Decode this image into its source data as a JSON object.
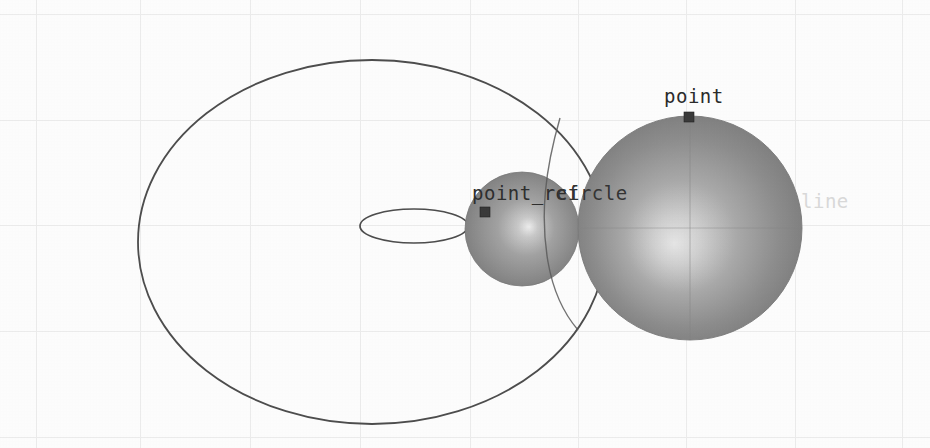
{
  "viewport": {
    "width": 930,
    "height": 448,
    "background_color": "#fdfdfd",
    "grid_color": "#ededed",
    "grid_vertical_x": [
      36,
      140,
      250,
      360,
      470,
      578,
      686,
      795,
      902
    ],
    "grid_horizontal_y": [
      14,
      120,
      225,
      331,
      437
    ]
  },
  "labels": {
    "point": "point",
    "point_ref": "point_ref",
    "circle": "circle",
    "line": "line"
  },
  "colors": {
    "label_dark": "#2b2b2b",
    "label_faint": "#d8d8d8",
    "outline_stroke": "#4a4a4a",
    "sphere_base": "#8f8f8f",
    "sphere_highlight": "#e8e8e8",
    "sphere_shadow": "#6e6e6e",
    "marker_fill": "#3a3a3a"
  },
  "geometry": {
    "spheres": [
      {
        "name": "sphere-large",
        "cx": 690,
        "cy": 228,
        "r": 112,
        "highlight_x": 676,
        "highlight_y": 245
      },
      {
        "name": "sphere-small",
        "cx": 522,
        "cy": 229,
        "r": 57,
        "highlight_x": 528,
        "highlight_y": 225
      }
    ],
    "ellipses": [
      {
        "name": "circle-outline-large",
        "cx": 372,
        "cy": 242,
        "rx": 234,
        "ry": 182
      },
      {
        "name": "circle-outline-small",
        "cx": 414,
        "cy": 226,
        "rx": 54,
        "ry": 17
      }
    ],
    "markers": [
      {
        "name": "point-marker",
        "x": 688,
        "y": 116,
        "size": 9
      },
      {
        "name": "point-ref-marker",
        "x": 484,
        "y": 211,
        "size": 9
      }
    ],
    "lines": [
      {
        "name": "axis-line-vertical-sphere",
        "x1": 690,
        "y1": 116,
        "x2": 690,
        "y2": 340
      },
      {
        "name": "axis-line-horizontal-sphere",
        "x1": 580,
        "y1": 228,
        "x2": 802,
        "y2": 228
      }
    ]
  }
}
